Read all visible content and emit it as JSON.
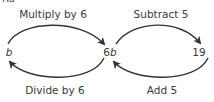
{
  "diagram": {
    "cropped_top_text": "Ra",
    "nodes": [
      {
        "id": "b",
        "prefix": "",
        "var": "b"
      },
      {
        "id": "6b",
        "prefix": "6",
        "var": "b"
      },
      {
        "id": "19",
        "prefix": "19",
        "var": ""
      }
    ],
    "operations": {
      "top_left": "Multiply by 6",
      "top_right": "Subtract 5",
      "bottom_left": "Divide by 6",
      "bottom_right": "Add 5"
    },
    "edges": [
      {
        "from": "b",
        "to": "6b",
        "label": "Multiply by 6",
        "direction": "forward"
      },
      {
        "from": "6b",
        "to": "19",
        "label": "Subtract 5",
        "direction": "forward"
      },
      {
        "from": "6b",
        "to": "b",
        "label": "Divide by 6",
        "direction": "inverse"
      },
      {
        "from": "19",
        "to": "6b",
        "label": "Add 5",
        "direction": "inverse"
      }
    ],
    "colors": {
      "arrow": "#333333",
      "text": "#3a3a3a"
    }
  }
}
